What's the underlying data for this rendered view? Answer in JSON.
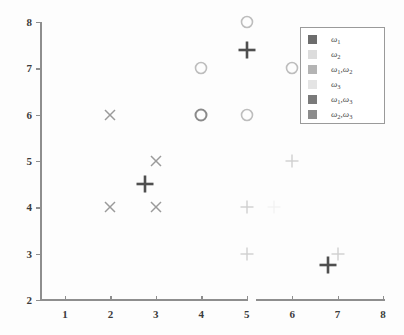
{
  "chart_data": {
    "type": "scatter",
    "title": "",
    "xlabel": "",
    "ylabel": "",
    "xlim": [
      1,
      8
    ],
    "ylim": [
      2,
      8
    ],
    "grid": false,
    "x_ticks": [
      "1",
      "2",
      "3",
      "4",
      "5",
      "6",
      "7",
      "8"
    ],
    "y_ticks": [
      "2",
      "3",
      "4",
      "5",
      "6",
      "7",
      "8"
    ],
    "legend_position": "upper right",
    "legend_entries": [
      {
        "label": "w1",
        "omega": "ω",
        "sub": "1",
        "color": "#6d6d6d"
      },
      {
        "label": "w2",
        "omega": "ω",
        "sub": "2",
        "color": "#dcdcdc"
      },
      {
        "label": "w1w2",
        "omega": "ω",
        "sub": "1,2",
        "color": "#b4b4b4"
      },
      {
        "label": "w3",
        "omega": "ω",
        "sub": "3",
        "color": "#e4e4e4"
      },
      {
        "label": "w1w3",
        "omega": "ω",
        "sub": "1,3",
        "color": "#7a7a7a"
      },
      {
        "label": "w2w3",
        "omega": "ω",
        "sub": "2,3",
        "color": "#8c8c8c"
      }
    ],
    "series": [
      {
        "name": "cross-markers",
        "marker": "x",
        "color": "#9a9a9a",
        "points": [
          {
            "x": 2,
            "y": 6
          },
          {
            "x": 2,
            "y": 4
          },
          {
            "x": 3,
            "y": 5
          },
          {
            "x": 3,
            "y": 4
          }
        ]
      },
      {
        "name": "bold-plus-markers",
        "marker": "plus-bold",
        "color": "#4f4f4f",
        "points": [
          {
            "x": 2.75,
            "y": 4.5
          },
          {
            "x": 5.0,
            "y": 7.4
          },
          {
            "x": 6.8,
            "y": 2.75
          }
        ]
      },
      {
        "name": "light-plus-markers",
        "marker": "plus-light",
        "color": "#cfcfcf",
        "points": [
          {
            "x": 5,
            "y": 4
          },
          {
            "x": 5,
            "y": 3
          },
          {
            "x": 6,
            "y": 5
          },
          {
            "x": 7,
            "y": 3
          },
          {
            "x": 5.6,
            "y": 4
          }
        ]
      },
      {
        "name": "circle-markers",
        "marker": "o",
        "color": "#bdbdbd",
        "points": [
          {
            "x": 4,
            "y": 7
          },
          {
            "x": 4,
            "y": 6
          },
          {
            "x": 5,
            "y": 8
          },
          {
            "x": 5,
            "y": 6
          },
          {
            "x": 6,
            "y": 7
          }
        ]
      }
    ]
  }
}
